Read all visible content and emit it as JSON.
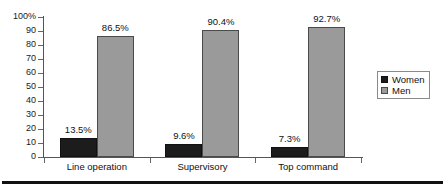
{
  "chart_data": {
    "type": "bar",
    "title": "",
    "subtitle": "",
    "xlabel": "",
    "ylabel": "",
    "categories": [
      "Line operation",
      "Supervisory",
      "Top command"
    ],
    "series": [
      {
        "name": "Women",
        "color": "#1c1c1c",
        "values": [
          13.5,
          9.6,
          7.3
        ],
        "value_labels": [
          "13.5%",
          "9.6%",
          "7.3%"
        ]
      },
      {
        "name": "Men",
        "color": "#9a9a9a",
        "values": [
          86.5,
          90.4,
          92.7
        ],
        "value_labels": [
          "86.5%",
          "90.4%",
          "92.7%"
        ]
      }
    ],
    "ylim": [
      0,
      100
    ],
    "ytick_values": [
      0,
      10,
      20,
      30,
      40,
      50,
      60,
      70,
      80,
      90,
      100
    ],
    "ytick_labels": [
      "0",
      "10",
      "20",
      "30",
      "40",
      "50",
      "60",
      "70",
      "80",
      "90",
      "100%"
    ],
    "grid": false,
    "legend_position": "right",
    "legend_entries": [
      "Women",
      "Men"
    ]
  },
  "axes": {
    "y_labels": [
      "100%",
      "90",
      "80",
      "70",
      "60",
      "50",
      "40",
      "30",
      "20",
      "10",
      "0"
    ],
    "x_labels": [
      "Line operation",
      "Supervisory",
      "Top command"
    ]
  },
  "legend": {
    "items": [
      {
        "label": "Women",
        "swatch": "women-swatch-icon"
      },
      {
        "label": "Men",
        "swatch": "men-swatch-icon"
      }
    ]
  }
}
